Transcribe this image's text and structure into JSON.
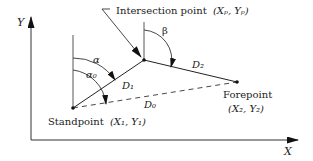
{
  "diagram": {
    "axes": {
      "x_label": "X",
      "y_label": "Y"
    },
    "points": {
      "standpoint": {
        "name": "Standpoint",
        "coords": "(X₁, Y₁)"
      },
      "intersection": {
        "name": "Intersection point",
        "coords": "(Xₚ, Yₚ)"
      },
      "forepoint": {
        "name": "Forepoint",
        "coords": "(X₂, Y₂)"
      }
    },
    "angles": {
      "alpha": "α",
      "alpha0": "α₀",
      "beta": "β"
    },
    "distances": {
      "d0": "D₀",
      "d1": "D₁",
      "d2": "D₂"
    },
    "colors": {
      "line": "#222222",
      "axis": "#333333"
    }
  }
}
